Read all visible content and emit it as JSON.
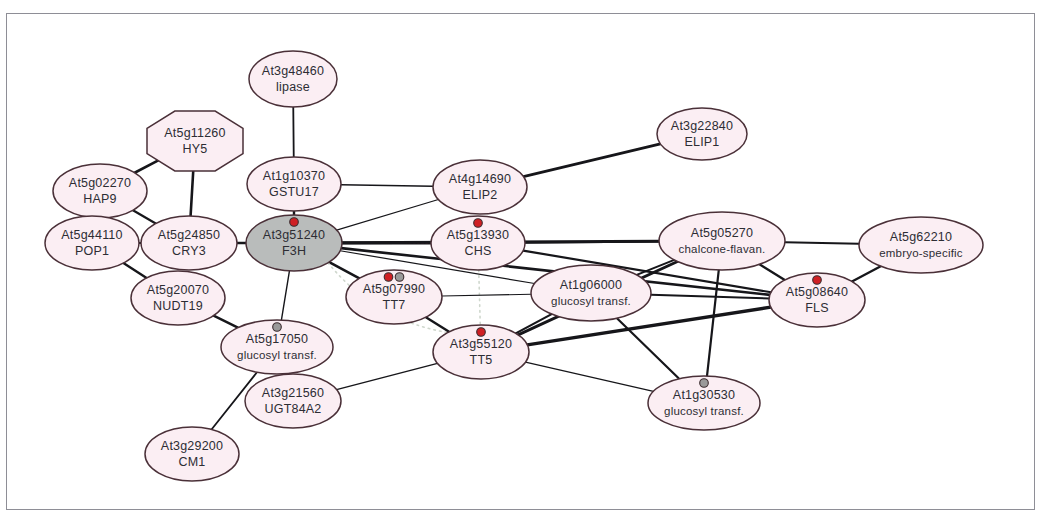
{
  "figure": {
    "type": "biological-interaction-network",
    "background_color": "#ffffff",
    "frame_color": "#8e8e96",
    "node_fill": "#fbeef3",
    "node_fill_highlighted": "#b9bcbb",
    "node_stroke": "#4a3038",
    "edge_color": "#16161a",
    "marker_red": "#cf2024",
    "marker_grey": "#9a9a9a",
    "dotted_grey_edge_color": "#cfd7cd",
    "dotted_red_edge_color": "#9a3746"
  },
  "nodes": [
    {
      "id": "At3g48460",
      "locus": "At3g48460",
      "name": "lipase",
      "x": 293,
      "y": 79,
      "rx": 44,
      "ry": 28,
      "shape": "ellipse",
      "highlighted": false,
      "markers": []
    },
    {
      "id": "At5g11260",
      "locus": "At5g11260",
      "name": "HY5",
      "x": 195,
      "y": 141,
      "rx": 48,
      "ry": 30,
      "shape": "octagon",
      "highlighted": false,
      "markers": []
    },
    {
      "id": "At5g02270",
      "locus": "At5g02270",
      "name": "HAP9",
      "x": 100,
      "y": 191,
      "rx": 47,
      "ry": 27,
      "shape": "ellipse",
      "highlighted": false,
      "markers": []
    },
    {
      "id": "At1g10370",
      "locus": "At1g10370",
      "name": "GSTU17",
      "x": 294,
      "y": 184,
      "rx": 47,
      "ry": 27,
      "shape": "ellipse",
      "highlighted": false,
      "markers": []
    },
    {
      "id": "At4g14690",
      "locus": "At4g14690",
      "name": "ELIP2",
      "x": 480,
      "y": 187,
      "rx": 47,
      "ry": 27,
      "shape": "ellipse",
      "highlighted": false,
      "markers": []
    },
    {
      "id": "At3g22840",
      "locus": "At3g22840",
      "name": "ELIP1",
      "x": 702,
      "y": 134,
      "rx": 45,
      "ry": 26,
      "shape": "ellipse",
      "highlighted": false,
      "markers": []
    },
    {
      "id": "At5g44110",
      "locus": "At5g44110",
      "name": "POP1",
      "x": 92,
      "y": 243,
      "rx": 47,
      "ry": 27,
      "shape": "ellipse",
      "highlighted": false,
      "markers": []
    },
    {
      "id": "At5g24850",
      "locus": "At5g24850",
      "name": "CRY3",
      "x": 189,
      "y": 243,
      "rx": 48,
      "ry": 27,
      "shape": "ellipse",
      "highlighted": false,
      "markers": []
    },
    {
      "id": "At3g51240",
      "locus": "At3g51240",
      "name": "F3H",
      "x": 294,
      "y": 243,
      "rx": 48,
      "ry": 28,
      "shape": "ellipse",
      "highlighted": true,
      "markers": [
        "red"
      ]
    },
    {
      "id": "At5g13930",
      "locus": "At5g13930",
      "name": "CHS",
      "x": 478,
      "y": 243,
      "rx": 47,
      "ry": 27,
      "shape": "ellipse",
      "highlighted": false,
      "markers": [
        "red"
      ]
    },
    {
      "id": "At5g05270",
      "locus": "At5g05270",
      "name": "chalcone-flavan.",
      "x": 722,
      "y": 241,
      "rx": 63,
      "ry": 29,
      "shape": "ellipse",
      "highlighted": false,
      "markers": []
    },
    {
      "id": "At5g62210",
      "locus": "At5g62210",
      "name": "embryo-specific",
      "x": 921,
      "y": 245,
      "rx": 62,
      "ry": 28,
      "shape": "ellipse",
      "highlighted": false,
      "markers": []
    },
    {
      "id": "At5g20070",
      "locus": "At5g20070",
      "name": "NUDT19",
      "x": 178,
      "y": 298,
      "rx": 47,
      "ry": 27,
      "shape": "ellipse",
      "highlighted": false,
      "markers": []
    },
    {
      "id": "At5g07990",
      "locus": "At5g07990",
      "name": "TT7",
      "x": 394,
      "y": 297,
      "rx": 48,
      "ry": 27,
      "shape": "ellipse",
      "highlighted": false,
      "markers": [
        "red",
        "grey"
      ]
    },
    {
      "id": "At1g06000",
      "locus": "At1g06000",
      "name": "glucosyl transf.",
      "x": 591,
      "y": 293,
      "rx": 60,
      "ry": 28,
      "shape": "ellipse",
      "highlighted": false,
      "markers": []
    },
    {
      "id": "At5g08640",
      "locus": "At5g08640",
      "name": "FLS",
      "x": 817,
      "y": 300,
      "rx": 48,
      "ry": 27,
      "shape": "ellipse",
      "highlighted": false,
      "markers": [
        "red"
      ]
    },
    {
      "id": "At5g17050",
      "locus": "At5g17050",
      "name": "glucosyl transf.",
      "x": 277,
      "y": 347,
      "rx": 56,
      "ry": 27,
      "shape": "ellipse",
      "highlighted": false,
      "markers": [
        "grey"
      ]
    },
    {
      "id": "At3g55120",
      "locus": "At3g55120",
      "name": "TT5",
      "x": 481,
      "y": 352,
      "rx": 48,
      "ry": 27,
      "shape": "ellipse",
      "highlighted": false,
      "markers": [
        "red"
      ]
    },
    {
      "id": "At3g21560",
      "locus": "At3g21560",
      "name": "UGT84A2",
      "x": 293,
      "y": 401,
      "rx": 48,
      "ry": 27,
      "shape": "ellipse",
      "highlighted": false,
      "markers": []
    },
    {
      "id": "At1g30530",
      "locus": "At1g30530",
      "name": "glucosyl transf.",
      "x": 704,
      "y": 403,
      "rx": 56,
      "ry": 27,
      "shape": "ellipse",
      "highlighted": false,
      "markers": [
        "grey"
      ]
    },
    {
      "id": "At3g29200",
      "locus": "At3g29200",
      "name": "CM1",
      "x": 192,
      "y": 454,
      "rx": 47,
      "ry": 27,
      "shape": "ellipse",
      "highlighted": false,
      "markers": []
    }
  ],
  "edges": [
    {
      "from": "At3g48460",
      "to": "At1g10370",
      "width": 1.8,
      "style": "solid"
    },
    {
      "from": "At5g11260",
      "to": "At5g02270",
      "width": 2.6,
      "style": "solid"
    },
    {
      "from": "At5g11260",
      "to": "At5g24850",
      "width": 2.6,
      "style": "solid"
    },
    {
      "from": "At5g02270",
      "to": "At5g44110",
      "width": 1.8,
      "style": "solid"
    },
    {
      "from": "At5g02270",
      "to": "At5g24850",
      "width": 2.2,
      "style": "solid"
    },
    {
      "from": "At5g44110",
      "to": "At5g24850",
      "width": 1.8,
      "style": "solid"
    },
    {
      "from": "At5g44110",
      "to": "At5g20070",
      "width": 2.4,
      "style": "solid"
    },
    {
      "from": "At5g24850",
      "to": "At3g51240",
      "width": 2.6,
      "style": "solid"
    },
    {
      "from": "At1g10370",
      "to": "At3g51240",
      "width": 2.4,
      "style": "solid"
    },
    {
      "from": "At1g10370",
      "to": "At4g14690",
      "width": 1.6,
      "style": "solid"
    },
    {
      "from": "At4g14690",
      "to": "At3g22840",
      "width": 2.8,
      "style": "solid"
    },
    {
      "from": "At4g14690",
      "to": "At3g51240",
      "width": 1.2,
      "style": "solid"
    },
    {
      "from": "At3g51240",
      "to": "At5g13930",
      "width": 3.2,
      "style": "solid-with-red-dots"
    },
    {
      "from": "At3g51240",
      "to": "At5g07990",
      "width": 2.6,
      "style": "solid"
    },
    {
      "from": "At3g51240",
      "to": "At5g17050",
      "width": 1.4,
      "style": "solid"
    },
    {
      "from": "At3g51240",
      "to": "At5g05270",
      "width": 3.0,
      "style": "solid"
    },
    {
      "from": "At3g51240",
      "to": "At5g08640",
      "width": 2.6,
      "style": "solid"
    },
    {
      "from": "At3g51240",
      "to": "At1g06000",
      "width": 1.2,
      "style": "solid"
    },
    {
      "from": "At3g51240",
      "to": "At3g55120",
      "width": 1.6,
      "style": "dotted-grey"
    },
    {
      "from": "At5g13930",
      "to": "At5g05270",
      "width": 2.2,
      "style": "solid"
    },
    {
      "from": "At5g13930",
      "to": "At5g08640",
      "width": 2.2,
      "style": "solid"
    },
    {
      "from": "At5g13930",
      "to": "At3g55120",
      "width": 1.6,
      "style": "dotted-grey"
    },
    {
      "from": "At5g05270",
      "to": "At5g62210",
      "width": 2.0,
      "style": "solid"
    },
    {
      "from": "At5g05270",
      "to": "At5g08640",
      "width": 2.4,
      "style": "solid"
    },
    {
      "from": "At5g05270",
      "to": "At1g06000",
      "width": 2.0,
      "style": "solid"
    },
    {
      "from": "At5g05270",
      "to": "At3g55120",
      "width": 3.0,
      "style": "solid"
    },
    {
      "from": "At5g05270",
      "to": "At1g30530",
      "width": 2.2,
      "style": "solid"
    },
    {
      "from": "At5g62210",
      "to": "At5g08640",
      "width": 2.4,
      "style": "solid"
    },
    {
      "from": "At1g06000",
      "to": "At5g08640",
      "width": 2.0,
      "style": "solid"
    },
    {
      "from": "At1g06000",
      "to": "At3g55120",
      "width": 2.2,
      "style": "solid"
    },
    {
      "from": "At1g06000",
      "to": "At1g30530",
      "width": 2.2,
      "style": "solid"
    },
    {
      "from": "At5g07990",
      "to": "At3g55120",
      "width": 2.4,
      "style": "solid"
    },
    {
      "from": "At5g07990",
      "to": "At1g06000",
      "width": 1.1,
      "style": "solid"
    },
    {
      "from": "At5g20070",
      "to": "At5g17050",
      "width": 2.4,
      "style": "solid"
    },
    {
      "from": "At5g17050",
      "to": "At3g21560",
      "width": 2.4,
      "style": "solid"
    },
    {
      "from": "At5g17050",
      "to": "At3g29200",
      "width": 1.8,
      "style": "solid"
    },
    {
      "from": "At3g21560",
      "to": "At3g55120",
      "width": 1.5,
      "style": "solid"
    },
    {
      "from": "At3g55120",
      "to": "At5g08640",
      "width": 3.4,
      "style": "solid"
    },
    {
      "from": "At3g55120",
      "to": "At1g30530",
      "width": 1.2,
      "style": "solid"
    }
  ]
}
